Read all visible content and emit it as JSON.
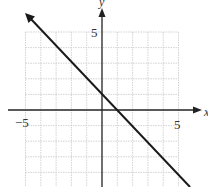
{
  "chart_data": {
    "type": "line",
    "title": "",
    "xlabel": "x",
    "ylabel": "y",
    "xlim": [
      -5,
      5
    ],
    "ylim": [
      -5,
      5
    ],
    "grid": true,
    "x_ticks_labeled": [
      -5,
      5
    ],
    "y_ticks_labeled": [
      5,
      -5
    ],
    "series": [
      {
        "name": "line",
        "equation": "y = -x + 1",
        "slope": -1,
        "y_intercept": 1,
        "x_intercept": 1,
        "points": [
          [
            -5,
            6
          ],
          [
            0,
            1
          ],
          [
            1,
            0
          ],
          [
            5,
            -4
          ],
          [
            5.5,
            -4.5
          ]
        ],
        "arrows": "both"
      }
    ]
  },
  "labels": {
    "x_neg": "−5",
    "x_pos": "5",
    "y_pos": "5",
    "y_neg": "−5",
    "x_axis": "x",
    "y_axis": "y"
  }
}
